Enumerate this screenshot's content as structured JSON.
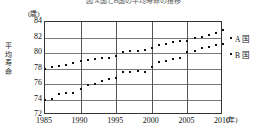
{
  "chart_data": {
    "type": "scatter",
    "title": "図 A国とB国の平均寿命の推移",
    "xlabel": "年",
    "ylabel": "平均寿命",
    "y_unit": "(歳)",
    "x_unit": "(年)",
    "xlim": [
      1985,
      2010
    ],
    "ylim": [
      72,
      84
    ],
    "yticks": [
      72,
      74,
      76,
      78,
      80,
      82,
      84
    ],
    "xticks": [
      1985,
      1990,
      1995,
      2000,
      2005,
      2010
    ],
    "grid": true,
    "legend_position": "right",
    "x": [
      1985,
      1986,
      1987,
      1988,
      1989,
      1990,
      1991,
      1992,
      1993,
      1994,
      1995,
      1996,
      1997,
      1998,
      1999,
      2000,
      2001,
      2002,
      2003,
      2004,
      2005,
      2006,
      2007,
      2008,
      2009,
      2010
    ],
    "series": [
      {
        "name": "A 国",
        "marker": "dot",
        "color": "#111111",
        "values": [
          78.0,
          78.2,
          78.3,
          78.4,
          78.7,
          79.0,
          79.1,
          79.2,
          79.3,
          79.4,
          79.6,
          80.1,
          80.2,
          80.3,
          80.4,
          80.6,
          81.0,
          81.2,
          81.4,
          81.6,
          81.6,
          82.0,
          82.1,
          82.3,
          82.6,
          83.0
        ]
      },
      {
        "name": "B 国",
        "marker": "dot",
        "color": "#111111",
        "values": [
          74.0,
          74.1,
          74.7,
          74.8,
          74.9,
          75.4,
          75.9,
          76.0,
          76.4,
          76.7,
          76.8,
          77.5,
          77.6,
          77.7,
          77.6,
          78.2,
          78.8,
          79.0,
          79.2,
          79.3,
          80.1,
          80.3,
          80.6,
          80.8,
          81.0,
          81.2
        ]
      }
    ]
  },
  "legend": {
    "items": [
      {
        "label": "A 国"
      },
      {
        "label": "B 国"
      }
    ]
  }
}
